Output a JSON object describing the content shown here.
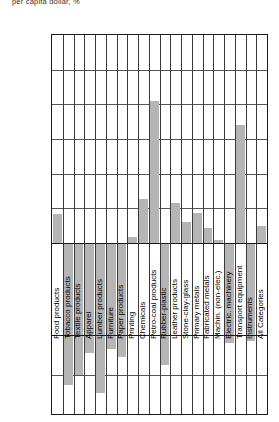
{
  "note": "per capita dollar, %",
  "chart_data": {
    "type": "bar",
    "title": "",
    "xlabel": "",
    "ylabel": "",
    "ylim": [
      -100,
      300
    ],
    "grid": true,
    "legend": "none",
    "yticks": [
      300,
      250,
      200,
      150,
      100,
      50,
      0,
      0,
      -50,
      -100
    ],
    "ytick_labels": [
      "300",
      "250",
      "200",
      "150",
      "100",
      "50",
      "0",
      "0",
      "-50",
      "-100"
    ],
    "categories": [
      "Food products",
      "Tobacco products",
      "Textile products",
      "Apparel",
      "Lumber products",
      "Furniture",
      "Paper products",
      "Printing",
      "Chemicals",
      "Petro-coal products",
      "Rubber-plastic",
      "Leather products",
      "Stone-clay-glass",
      "Primary metals",
      "Fabricated metals",
      "Machin. (non-elec.)",
      "Electric. machinery",
      "Transport equipment",
      "Instruments",
      "All Categories"
    ],
    "values": [
      42,
      -62,
      -50,
      -22,
      -73,
      -18,
      -28,
      8,
      63,
      205,
      -37,
      57,
      31,
      43,
      22,
      5,
      -10,
      170,
      -8,
      25
    ],
    "bar_color": "#b5b5b5"
  }
}
